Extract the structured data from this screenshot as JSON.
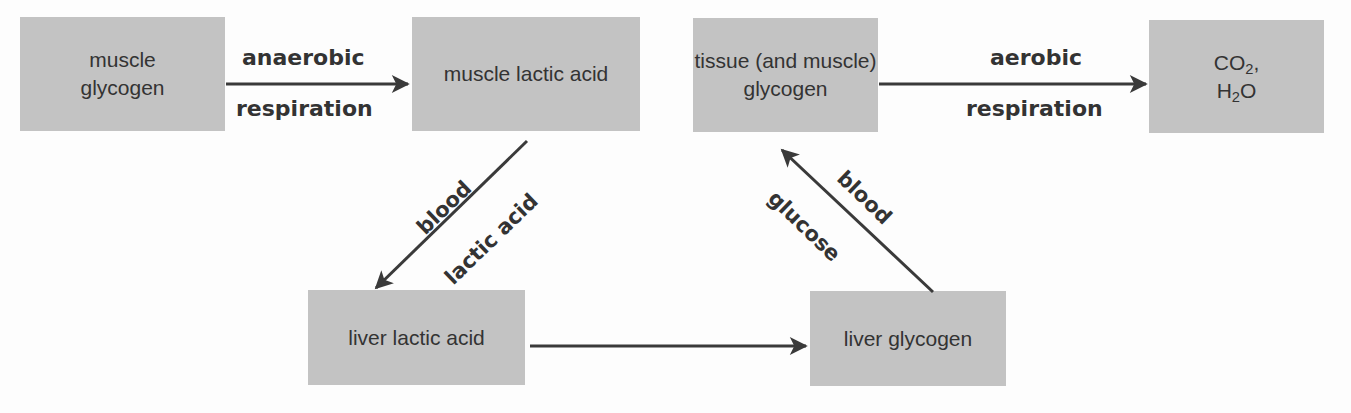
{
  "diagram": {
    "nodes": {
      "muscle_glycogen": {
        "line1": "muscle",
        "line2": "glycogen"
      },
      "muscle_lactic_acid": {
        "line1": "muscle lactic acid"
      },
      "tissue_glycogen": {
        "line1": "tissue (and muscle)",
        "line2": "glycogen"
      },
      "co2_h2o": {
        "co": "CO",
        "co_sub": "2",
        "co_suffix": ",",
        "h": "H",
        "h_sub": "2",
        "h_suffix": "O"
      },
      "liver_lactic_acid": {
        "line1": "liver lactic acid"
      },
      "liver_glycogen": {
        "line1": "liver glycogen"
      }
    },
    "edges": {
      "anaerobic": {
        "top": "anaerobic",
        "bottom": "respiration"
      },
      "aerobic": {
        "top": "aerobic",
        "bottom": "respiration"
      },
      "blood_lactic": {
        "outer": "blood",
        "inner": "lactic acid"
      },
      "blood_glucose": {
        "outer": "blood",
        "inner": "glucose"
      }
    },
    "colors": {
      "box": "#c3c3c3",
      "text": "#333333",
      "arrow": "#3a3a3a"
    }
  }
}
